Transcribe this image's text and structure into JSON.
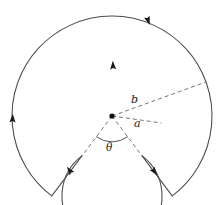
{
  "figure": {
    "type": "geometry-diagram",
    "background_color": "#ffffff",
    "stroke_color": "#4a4a4a",
    "dashed_stroke_color": "#6e6e6e",
    "arrow_color": "#1a1a1a",
    "label_color": "#1a1a1a"
  },
  "geometry": {
    "center": {
      "x": 112,
      "y": 116
    },
    "inner_radius": 50,
    "outer_radius": 100,
    "gap_start_angle_deg": 53,
    "gap_end_angle_deg": 127,
    "gap_angle_theta_deg": 74,
    "theta_arc_radius": 26
  },
  "labels": {
    "outer_radius": "b",
    "inner_radius": "a",
    "gap_angle": "θ"
  },
  "paths": {
    "outer_arc": "M 51.8 195.9 A 100 100 0 1 1 172.2 195.9",
    "inner_arc": "M 81.9 155.9 A 50 50 0 1 0 142.1 155.9",
    "left_radial_edge": "M 81.9 155.9 L 51.8 195.9",
    "right_radial_edge": "M 142.1 155.9 L 172.2 195.9",
    "radius_b_dashed": "M 112 116 L 206.0 82.0",
    "radius_a_dashed": "M 112 116 L 161.5 123.0",
    "gap_edge_left_dashed": "M 112 116 L 81.9 155.9",
    "gap_edge_right_dashed": "M 112 116 L 142.1 155.9",
    "theta_arc": "M 96.4 136.8 A 26 26 0 0 0 127.6 136.8"
  },
  "arrowheads": [
    {
      "name": "outer-arc-top-arrow",
      "x": 148,
      "y": 20,
      "rotation_deg": 70
    },
    {
      "name": "outer-arc-left-arrow",
      "x": 12.6,
      "y": 119,
      "rotation_deg": 272
    },
    {
      "name": "inner-arc-top-arrow",
      "x": 113,
      "y": 66,
      "rotation_deg": 268
    },
    {
      "name": "left-radial-arrow",
      "x": 70,
      "y": 171,
      "rotation_deg": 233
    },
    {
      "name": "right-radial-arrow",
      "x": 154,
      "y": 171,
      "rotation_deg": 53
    }
  ]
}
